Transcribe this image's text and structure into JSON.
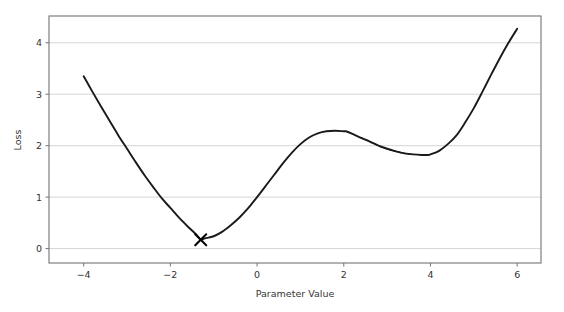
{
  "chart_data": {
    "type": "line",
    "title": "",
    "xlabel": "Parameter Value",
    "ylabel": "Loss",
    "xlim": [
      -4.8,
      6.55
    ],
    "ylim": [
      -0.28,
      4.52
    ],
    "xticks": [
      -4,
      -2,
      0,
      2,
      4,
      6
    ],
    "xtick_labels": [
      "−4",
      "−2",
      "0",
      "2",
      "4",
      "6"
    ],
    "yticks": [
      0,
      1,
      2,
      3,
      4
    ],
    "ytick_labels": [
      "0",
      "1",
      "2",
      "3",
      "4"
    ],
    "grid": "horizontal",
    "legend": "none",
    "line_color": "#1a1a1a",
    "grid_color": "#d0d0d0",
    "spine_color": "#737373",
    "background_color": "#ffffff",
    "series": [
      {
        "name": "loss-curve",
        "style": "solid",
        "color": "#1a1a1a",
        "x": [
          -4.0,
          -3.8,
          -3.6,
          -3.4,
          -3.2,
          -3.0,
          -2.8,
          -2.6,
          -2.4,
          -2.2,
          -2.0,
          -1.8,
          -1.6,
          -1.4,
          -1.3,
          -1.2,
          -1.0,
          -0.8,
          -0.6,
          -0.4,
          -0.2,
          0.0,
          0.2,
          0.4,
          0.6,
          0.8,
          1.0,
          1.2,
          1.4,
          1.6,
          1.8,
          2.0,
          2.05,
          2.2,
          2.4,
          2.6,
          2.8,
          3.0,
          3.2,
          3.4,
          3.6,
          3.8,
          3.95,
          4.0,
          4.2,
          4.4,
          4.6,
          4.8,
          5.0,
          5.2,
          5.4,
          5.6,
          5.8,
          6.0
        ],
        "y": [
          3.35,
          3.05,
          2.76,
          2.48,
          2.2,
          1.94,
          1.68,
          1.43,
          1.2,
          0.98,
          0.79,
          0.6,
          0.43,
          0.27,
          0.18,
          0.2,
          0.24,
          0.33,
          0.46,
          0.61,
          0.79,
          1.0,
          1.22,
          1.44,
          1.66,
          1.86,
          2.03,
          2.16,
          2.24,
          2.28,
          2.29,
          2.28,
          2.28,
          2.23,
          2.15,
          2.08,
          2.0,
          1.94,
          1.89,
          1.85,
          1.83,
          1.82,
          1.82,
          1.83,
          1.9,
          2.03,
          2.2,
          2.45,
          2.73,
          3.05,
          3.38,
          3.7,
          4.0,
          4.27
        ]
      },
      {
        "name": "optimizer-path-overlay",
        "style": "dashed",
        "color": "#1a1a1a",
        "x": [
          2.4,
          2.6,
          2.8,
          3.0,
          3.2,
          3.4,
          3.6
        ],
        "y": [
          2.15,
          2.08,
          2.0,
          1.94,
          1.89,
          1.85,
          1.83
        ]
      }
    ],
    "markers": [
      {
        "name": "global-minimum-marker",
        "symbol": "x",
        "x": -1.3,
        "y": 0.17,
        "color": "#000000",
        "size": 11
      }
    ]
  }
}
